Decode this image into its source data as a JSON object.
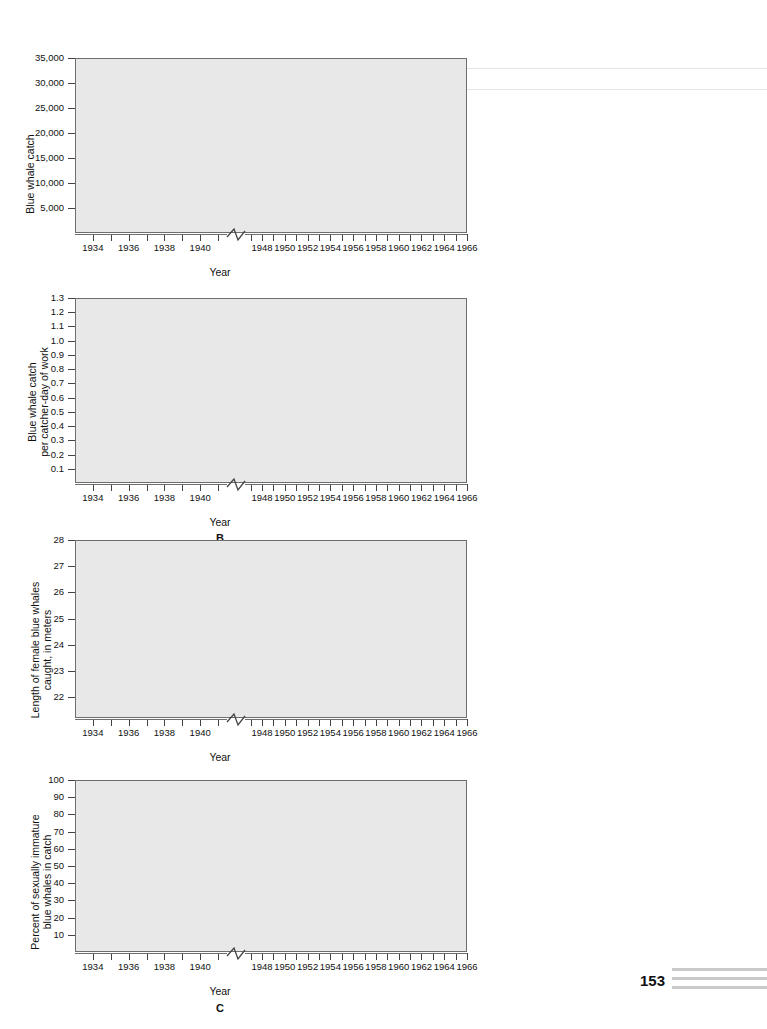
{
  "page": {
    "number": "153",
    "background": "#ffffff",
    "plot_background": "#e8e8e8",
    "curve_color": "#4d4d4d",
    "axis_color": "#6e6e6e"
  },
  "common": {
    "xlabel": "Year",
    "x_tick_labels_left": [
      "1934",
      "1936",
      "1938",
      "1940"
    ],
    "x_tick_labels_right": [
      "1948",
      "1950",
      "1952",
      "1954",
      "1956",
      "1958",
      "1960",
      "1962",
      "1964",
      "1966"
    ],
    "axis_break": "zigzag-break"
  },
  "chart_data": [
    {
      "id": "panel-a",
      "type": "line",
      "title": "",
      "panel_letter": "",
      "xlabel": "Year",
      "ylabel": "Blue whale catch",
      "ylim": [
        0,
        35000
      ],
      "ytick_labels": [
        "5,000",
        "10,000",
        "15,000",
        "20,000",
        "25,000",
        "30,000",
        "35,000"
      ],
      "ytick_values": [
        5000,
        10000,
        15000,
        20000,
        25000,
        30000,
        35000
      ],
      "xlim_left": [
        1933,
        1941.5
      ],
      "xlim_right": [
        1946.5,
        1966
      ],
      "series": [
        {
          "name": "pre-war catch",
          "x": [
            1934.0,
            1934.4,
            1935.0,
            1935.5,
            1936.0,
            1936.5,
            1937.0,
            1937.5,
            1938.1,
            1938.6,
            1939.0,
            1939.6,
            1940.2,
            1940.8,
            1941.2
          ],
          "y": [
            5000,
            8500,
            12400,
            10600,
            8700,
            10500,
            16500,
            23500,
            28100,
            20500,
            17800,
            17300,
            17900,
            17800,
            16400
          ]
        },
        {
          "name": "post-war catch",
          "x": [
            1947.0,
            1947.6,
            1948.3,
            1949.0,
            1949.6,
            1950.2,
            1950.8,
            1951.4,
            1952.0,
            1952.6,
            1953.2,
            1953.8,
            1954.4,
            1955.2,
            1956.0,
            1956.8,
            1957.4,
            1958.2,
            1958.8,
            1959.6,
            1960.4,
            1961.2,
            1962.0,
            1962.8,
            1963.4,
            1964.0,
            1964.6,
            1964.9
          ],
          "y": [
            15400,
            18200,
            21200,
            22700,
            20900,
            20600,
            22200,
            21300,
            20500,
            22800,
            27500,
            30600,
            31200,
            30400,
            29100,
            28200,
            28100,
            29900,
            31000,
            30600,
            28300,
            25200,
            21500,
            19000,
            16100,
            11000,
            5800,
            3700
          ]
        }
      ]
    },
    {
      "id": "panel-b",
      "type": "line",
      "title": "",
      "panel_letter": "B",
      "xlabel": "Year",
      "ylabel": "Blue whale catch\nper catcher-day of work",
      "ylabel_line1": "Blue whale catch",
      "ylabel_line2": "per catcher-day of work",
      "ylim": [
        0,
        1.3
      ],
      "ytick_labels": [
        "0.1",
        "0.2",
        "0.3",
        "0.4",
        "0.5",
        "0.6",
        "0.7",
        "0.8",
        "0.9",
        "1.0",
        "1.1",
        "1.2",
        "1.3"
      ],
      "ytick_values": [
        0.1,
        0.2,
        0.3,
        0.4,
        0.5,
        0.6,
        0.7,
        0.8,
        0.9,
        1.0,
        1.1,
        1.2,
        1.3
      ],
      "xlim_left": [
        1933,
        1941.5
      ],
      "xlim_right": [
        1946.5,
        1966
      ],
      "series": [
        {
          "name": "pre-war CPUE",
          "x": [
            1934.0,
            1934.5,
            1935.0,
            1935.5,
            1936.0,
            1936.6,
            1937.2,
            1937.8,
            1938.4,
            1939.0,
            1939.5,
            1940.0,
            1940.6,
            1941.0,
            1941.2
          ],
          "y": [
            0.95,
            1.07,
            1.19,
            1.23,
            1.16,
            1.02,
            0.92,
            0.87,
            0.93,
            1.0,
            0.94,
            0.79,
            0.63,
            0.55,
            0.57
          ]
        },
        {
          "name": "post-war CPUE",
          "x": [
            1947.0,
            1947.6,
            1948.2,
            1948.8,
            1949.4,
            1950.0,
            1950.5,
            1951.1,
            1951.7,
            1952.3,
            1952.9,
            1953.5,
            1954.1,
            1954.8,
            1955.4,
            1956.0,
            1956.7,
            1957.4,
            1958.0,
            1958.7,
            1959.4,
            1960.1,
            1960.8,
            1961.4,
            1962.0,
            1962.6,
            1963.0
          ],
          "y": [
            0.55,
            0.44,
            0.35,
            0.29,
            0.28,
            0.33,
            0.32,
            0.26,
            0.21,
            0.2,
            0.19,
            0.16,
            0.11,
            0.12,
            0.14,
            0.12,
            0.11,
            0.15,
            0.15,
            0.13,
            0.11,
            0.09,
            0.1,
            0.12,
            0.11,
            0.09,
            0.11
          ]
        }
      ]
    },
    {
      "id": "panel-c-length",
      "type": "line",
      "title": "",
      "panel_letter": "",
      "xlabel": "Year",
      "ylabel": "Length of female blue whales\ncaught, in meters",
      "ylabel_line1": "Length of female blue whales",
      "ylabel_line2": "caught, in meters",
      "ylim": [
        21.2,
        28
      ],
      "ytick_labels": [
        "22",
        "23",
        "24",
        "25",
        "26",
        "27",
        "28"
      ],
      "ytick_values": [
        22,
        23,
        24,
        25,
        26,
        27,
        28
      ],
      "xlim_left": [
        1933,
        1941.5
      ],
      "xlim_right": [
        1946.5,
        1966
      ],
      "series": [
        {
          "name": "pre-war length",
          "x": [
            1933.7,
            1934.2,
            1934.8,
            1935.4,
            1935.9,
            1936.4,
            1937.0,
            1937.6,
            1938.3,
            1939.0,
            1939.8
          ],
          "y": [
            26.5,
            25.8,
            25.3,
            25.2,
            25.3,
            25.0,
            24.5,
            24.2,
            24.1,
            24.1,
            24.1
          ]
        },
        {
          "name": "post-war length",
          "x": [
            1946.9,
            1947.6,
            1948.3,
            1949.0,
            1949.6,
            1950.2,
            1950.9,
            1951.6,
            1952.2,
            1952.8,
            1953.4,
            1954.1,
            1954.8,
            1955.5,
            1956.2,
            1957.0,
            1957.8,
            1958.6,
            1959.2,
            1959.7,
            1960.4,
            1961.2,
            1961.8,
            1962.4,
            1963.0,
            1963.6,
            1964.0
          ],
          "y": [
            24.05,
            24.1,
            24.3,
            24.8,
            24.85,
            24.4,
            23.7,
            23.75,
            23.8,
            23.5,
            23.35,
            23.5,
            23.7,
            23.7,
            23.5,
            23.3,
            23.3,
            23.5,
            24.1,
            24.5,
            23.8,
            22.6,
            22.15,
            22.5,
            23.3,
            22.4,
            21.4
          ]
        }
      ]
    },
    {
      "id": "panel-c",
      "type": "line",
      "title": "",
      "panel_letter": "C",
      "xlabel": "Year",
      "ylabel": "Percent of sexually immature\nblue whales in catch",
      "ylabel_line1": "Percent of sexually immature",
      "ylabel_line2": "blue whales in catch",
      "ylim": [
        0,
        100
      ],
      "ytick_labels": [
        "10",
        "20",
        "30",
        "40",
        "50",
        "60",
        "70",
        "80",
        "90",
        "100"
      ],
      "ytick_values": [
        10,
        20,
        30,
        40,
        50,
        60,
        70,
        80,
        90,
        100
      ],
      "xlim_left": [
        1933,
        1941.5
      ],
      "xlim_right": [
        1946.5,
        1966
      ],
      "series": [
        {
          "name": "pre-war immature percent",
          "x": [
            1934.0,
            1934.4,
            1934.9,
            1935.3,
            1935.8,
            1936.3,
            1936.9,
            1937.5,
            1938.1,
            1938.6,
            1939.1,
            1939.7,
            1940.2,
            1940.7,
            1941.0
          ],
          "y": [
            6,
            14,
            21,
            23,
            18,
            15,
            22,
            33,
            44,
            45,
            37,
            41,
            44,
            44,
            33
          ]
        },
        {
          "name": "post-war immature percent",
          "x": [
            1946.9,
            1947.5,
            1948.2,
            1948.9,
            1949.5,
            1950.1,
            1950.8,
            1951.5,
            1952.2,
            1953.0,
            1953.6,
            1954.2,
            1954.9,
            1955.6,
            1956.3,
            1957.0,
            1957.7,
            1958.4,
            1959.1,
            1959.7,
            1960.2,
            1960.8,
            1961.4,
            1962.1,
            1962.6,
            1963.1,
            1963.6,
            1964.1
          ],
          "y": [
            37,
            38,
            32,
            26,
            25,
            29,
            33,
            36,
            40,
            43,
            43,
            40,
            38,
            38,
            41,
            43,
            41,
            38,
            38,
            36,
            30,
            31,
            44,
            64,
            62,
            55,
            62,
            74
          ]
        }
      ]
    }
  ]
}
